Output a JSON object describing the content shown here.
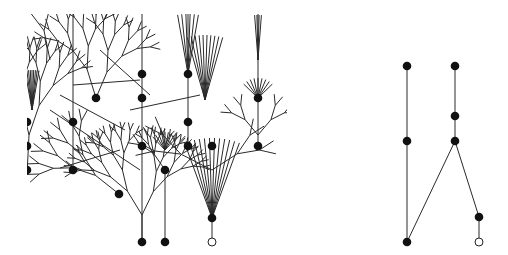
{
  "diagram": {
    "colors": {
      "edge": "#2a2a2a",
      "node": "#111111",
      "open_node_fill": "#ffffff",
      "background": "#ffffff"
    },
    "left_tree": {
      "filled_nodes": [
        [
          27,
          122
        ],
        [
          27,
          146
        ],
        [
          27,
          170
        ],
        [
          73,
          122
        ],
        [
          73,
          170
        ],
        [
          96,
          98
        ],
        [
          119,
          194
        ],
        [
          142,
          74
        ],
        [
          142,
          98
        ],
        [
          142,
          146
        ],
        [
          142,
          242
        ],
        [
          165,
          170
        ],
        [
          165,
          242
        ],
        [
          188,
          74
        ],
        [
          188,
          122
        ],
        [
          188,
          146
        ],
        [
          212,
          146
        ],
        [
          212,
          218
        ],
        [
          258,
          98
        ],
        [
          258,
          146
        ]
      ],
      "open_nodes": [
        [
          212,
          242
        ]
      ]
    },
    "right_graph": {
      "filled_nodes": [
        [
          407,
          66
        ],
        [
          455,
          66
        ],
        [
          455,
          116
        ],
        [
          407,
          141
        ],
        [
          455,
          141
        ],
        [
          407,
          242
        ],
        [
          479,
          217
        ]
      ],
      "open_nodes": [
        [
          479,
          242
        ]
      ],
      "edges": [
        [
          [
            407,
            66
          ],
          [
            407,
            141
          ]
        ],
        [
          [
            407,
            141
          ],
          [
            407,
            242
          ]
        ],
        [
          [
            455,
            66
          ],
          [
            455,
            116
          ]
        ],
        [
          [
            455,
            116
          ],
          [
            455,
            141
          ]
        ],
        [
          [
            455,
            141
          ],
          [
            407,
            242
          ]
        ],
        [
          [
            455,
            141
          ],
          [
            479,
            217
          ]
        ],
        [
          [
            479,
            217
          ],
          [
            479,
            242
          ]
        ]
      ]
    }
  }
}
